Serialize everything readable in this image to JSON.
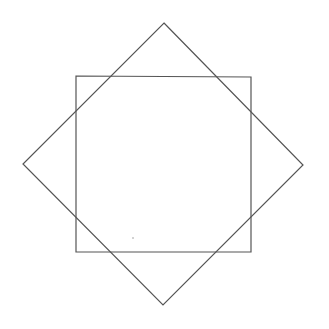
{
  "diagram": {
    "stroke_color": "#555555",
    "background": "#ffffff",
    "shapes": [
      {
        "name": "upright-square",
        "points": [
          [
            76,
            76
          ],
          [
            251,
            77
          ],
          [
            251,
            252
          ],
          [
            76,
            252
          ]
        ]
      },
      {
        "name": "rotated-square",
        "points": [
          [
            164,
            23
          ],
          [
            303,
            165
          ],
          [
            163,
            305
          ],
          [
            23,
            164
          ]
        ]
      }
    ],
    "dot": {
      "x": 133,
      "y": 238
    }
  }
}
